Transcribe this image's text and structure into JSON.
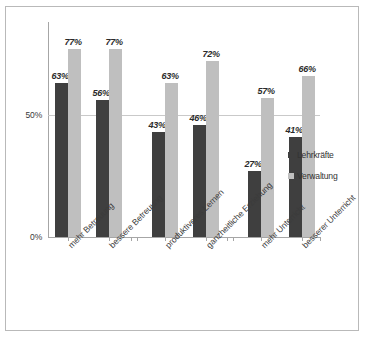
{
  "chart_data": {
    "type": "bar",
    "title": "",
    "xlabel": "",
    "ylabel": "",
    "ylim": [
      0,
      85
    ],
    "grid": true,
    "legend_position": "right",
    "ytick_labels": [
      "50%",
      "0%"
    ],
    "ytick_values": [
      50,
      0
    ],
    "categories": [
      "mehr Betreuung",
      "bessere Betreuung",
      "produktiveres Lernen",
      "ganzheitliche Erziehung",
      "mehr Unterricht",
      "besserer Unterricht"
    ],
    "series": [
      {
        "name": "Lehrkräfte",
        "color": "#3f3f3f",
        "values": [
          63,
          56,
          43,
          46,
          27,
          41
        ],
        "labels": [
          "63%",
          "56%",
          "43%",
          "46%",
          "27%",
          "41%"
        ]
      },
      {
        "name": "Verwaltung",
        "color": "#bfbfbf",
        "values": [
          77,
          77,
          63,
          72,
          57,
          66
        ],
        "labels": [
          "77%",
          "77%",
          "63%",
          "72%",
          "57%",
          "66%"
        ]
      }
    ]
  },
  "legend": {
    "items": [
      {
        "label": "Lehrkräfte"
      },
      {
        "label": "Verwaltung"
      }
    ]
  }
}
